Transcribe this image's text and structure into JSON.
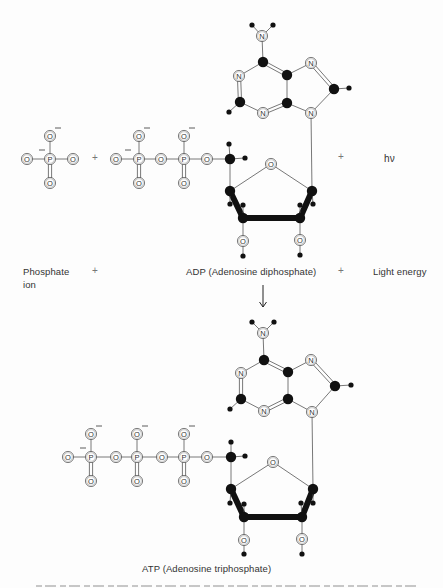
{
  "figure": {
    "background": "#fdfdfd",
    "ink": "#111111",
    "line_color": "#555555"
  },
  "labels": {
    "phosphate_line1": "Phosphate",
    "phosphate_line2": "ion",
    "plus_1": "+",
    "adp": "ADP (Adenosine diphosphate)",
    "plus_2": "+",
    "light_energy": "Light energy",
    "plus_top_1": "+",
    "plus_top_2": "+",
    "h_nu": "hν",
    "atp": "ATP (Adenosine triphosphate)"
  },
  "reaction_arrow": {
    "x": 263,
    "y1": 285,
    "y2": 307
  },
  "molecules": [
    {
      "name": "phosphate-ion",
      "atoms": [
        {
          "el": "O",
          "x": 27,
          "y": 159
        },
        {
          "el": "P",
          "x": 50,
          "y": 159
        },
        {
          "el": "O",
          "x": 73,
          "y": 159
        },
        {
          "el": "O",
          "x": 50,
          "y": 136
        },
        {
          "el": "O",
          "x": 50,
          "y": 183
        }
      ],
      "bonds": [
        [
          0,
          1,
          1
        ],
        [
          1,
          2,
          1
        ],
        [
          1,
          3,
          1
        ],
        [
          1,
          4,
          2
        ]
      ],
      "charges": [
        {
          "x": 39,
          "y": 150
        },
        {
          "x": 55,
          "y": 128
        }
      ]
    },
    {
      "name": "adp",
      "atoms": [
        {
          "el": "O",
          "x": 116,
          "y": 159
        },
        {
          "el": "P",
          "x": 139,
          "y": 159
        },
        {
          "el": "O",
          "x": 139,
          "y": 136
        },
        {
          "el": "O",
          "x": 139,
          "y": 183
        },
        {
          "el": "O",
          "x": 161,
          "y": 159
        },
        {
          "el": "P",
          "x": 184,
          "y": 159
        },
        {
          "el": "O",
          "x": 184,
          "y": 136
        },
        {
          "el": "O",
          "x": 184,
          "y": 183
        },
        {
          "el": "O",
          "x": 207,
          "y": 159
        },
        {
          "el": "C",
          "x": 230,
          "y": 159
        },
        {
          "el": "H",
          "x": 229,
          "y": 144
        },
        {
          "el": "H",
          "x": 245,
          "y": 158
        },
        {
          "el": "O",
          "x": 271,
          "y": 164
        },
        {
          "el": "C",
          "x": 230,
          "y": 191
        },
        {
          "el": "C",
          "x": 312,
          "y": 191
        },
        {
          "el": "C",
          "x": 243,
          "y": 218
        },
        {
          "el": "C",
          "x": 300,
          "y": 218
        },
        {
          "el": "H",
          "x": 230,
          "y": 204
        },
        {
          "el": "H",
          "x": 243,
          "y": 205
        },
        {
          "el": "H",
          "x": 300,
          "y": 205
        },
        {
          "el": "H",
          "x": 313,
          "y": 204
        },
        {
          "el": "O",
          "x": 243,
          "y": 241
        },
        {
          "el": "H",
          "x": 243,
          "y": 256
        },
        {
          "el": "O",
          "x": 300,
          "y": 240
        },
        {
          "el": "H",
          "x": 300,
          "y": 255
        },
        {
          "el": "N",
          "x": 262,
          "y": 36
        },
        {
          "el": "H",
          "x": 252,
          "y": 25
        },
        {
          "el": "H",
          "x": 273,
          "y": 25
        },
        {
          "el": "C",
          "x": 263,
          "y": 62
        },
        {
          "el": "N",
          "x": 239,
          "y": 76
        },
        {
          "el": "C",
          "x": 240,
          "y": 102
        },
        {
          "el": "H",
          "x": 229,
          "y": 112
        },
        {
          "el": "N",
          "x": 263,
          "y": 113
        },
        {
          "el": "C",
          "x": 287,
          "y": 103
        },
        {
          "el": "C",
          "x": 287,
          "y": 75
        },
        {
          "el": "N",
          "x": 311,
          "y": 63
        },
        {
          "el": "C",
          "x": 334,
          "y": 89
        },
        {
          "el": "H",
          "x": 349,
          "y": 88
        },
        {
          "el": "N",
          "x": 311,
          "y": 113
        }
      ],
      "bonds": [
        [
          0,
          1,
          1
        ],
        [
          1,
          2,
          1
        ],
        [
          1,
          3,
          2
        ],
        [
          1,
          4,
          1
        ],
        [
          4,
          5,
          1
        ],
        [
          5,
          6,
          1
        ],
        [
          5,
          7,
          2
        ],
        [
          5,
          8,
          1
        ],
        [
          8,
          9,
          1
        ],
        [
          9,
          10,
          1
        ],
        [
          9,
          11,
          1
        ],
        [
          9,
          13,
          1
        ],
        [
          13,
          12,
          1
        ],
        [
          12,
          14,
          1
        ],
        [
          13,
          15,
          3
        ],
        [
          15,
          16,
          3
        ],
        [
          16,
          14,
          3
        ],
        [
          13,
          17,
          1
        ],
        [
          15,
          18,
          1
        ],
        [
          16,
          19,
          1
        ],
        [
          14,
          20,
          1
        ],
        [
          15,
          21,
          1
        ],
        [
          21,
          22,
          1
        ],
        [
          16,
          23,
          1
        ],
        [
          23,
          24,
          1
        ],
        [
          25,
          26,
          1
        ],
        [
          25,
          27,
          1
        ],
        [
          25,
          28,
          1
        ],
        [
          28,
          29,
          1
        ],
        [
          29,
          30,
          2
        ],
        [
          30,
          31,
          1
        ],
        [
          30,
          32,
          1
        ],
        [
          32,
          33,
          2
        ],
        [
          33,
          34,
          1
        ],
        [
          34,
          28,
          2
        ],
        [
          34,
          35,
          1
        ],
        [
          35,
          36,
          2
        ],
        [
          36,
          37,
          1
        ],
        [
          36,
          38,
          1
        ],
        [
          38,
          33,
          1
        ],
        [
          38,
          14,
          1
        ]
      ],
      "charges": [
        {
          "x": 125,
          "y": 150
        },
        {
          "x": 144,
          "y": 128
        },
        {
          "x": 189,
          "y": 128
        }
      ]
    },
    {
      "name": "atp",
      "atoms": [
        {
          "el": "O",
          "x": 68,
          "y": 457
        },
        {
          "el": "P",
          "x": 91,
          "y": 457
        },
        {
          "el": "O",
          "x": 91,
          "y": 434
        },
        {
          "el": "O",
          "x": 91,
          "y": 481
        },
        {
          "el": "O",
          "x": 116,
          "y": 457
        },
        {
          "el": "P",
          "x": 137,
          "y": 457
        },
        {
          "el": "O",
          "x": 137,
          "y": 434
        },
        {
          "el": "O",
          "x": 137,
          "y": 481
        },
        {
          "el": "O",
          "x": 162,
          "y": 457
        },
        {
          "el": "P",
          "x": 184,
          "y": 457
        },
        {
          "el": "O",
          "x": 184,
          "y": 434
        },
        {
          "el": "O",
          "x": 184,
          "y": 481
        },
        {
          "el": "O",
          "x": 207,
          "y": 457
        },
        {
          "el": "C",
          "x": 231,
          "y": 457
        },
        {
          "el": "H",
          "x": 231,
          "y": 442
        },
        {
          "el": "H",
          "x": 245,
          "y": 456
        },
        {
          "el": "O",
          "x": 273,
          "y": 462
        },
        {
          "el": "C",
          "x": 231,
          "y": 489
        },
        {
          "el": "C",
          "x": 313,
          "y": 489
        },
        {
          "el": "C",
          "x": 244,
          "y": 517
        },
        {
          "el": "C",
          "x": 302,
          "y": 517
        },
        {
          "el": "H",
          "x": 230,
          "y": 503
        },
        {
          "el": "H",
          "x": 244,
          "y": 504
        },
        {
          "el": "H",
          "x": 301,
          "y": 503
        },
        {
          "el": "H",
          "x": 313,
          "y": 503
        },
        {
          "el": "O",
          "x": 244,
          "y": 540
        },
        {
          "el": "H",
          "x": 244,
          "y": 554
        },
        {
          "el": "O",
          "x": 302,
          "y": 539
        },
        {
          "el": "H",
          "x": 302,
          "y": 554
        },
        {
          "el": "N",
          "x": 263,
          "y": 333
        },
        {
          "el": "H",
          "x": 252,
          "y": 322
        },
        {
          "el": "H",
          "x": 274,
          "y": 322
        },
        {
          "el": "C",
          "x": 264,
          "y": 360
        },
        {
          "el": "N",
          "x": 241,
          "y": 373
        },
        {
          "el": "C",
          "x": 241,
          "y": 399
        },
        {
          "el": "H",
          "x": 230,
          "y": 409
        },
        {
          "el": "N",
          "x": 264,
          "y": 411
        },
        {
          "el": "C",
          "x": 288,
          "y": 399
        },
        {
          "el": "C",
          "x": 288,
          "y": 372
        },
        {
          "el": "N",
          "x": 311,
          "y": 360
        },
        {
          "el": "C",
          "x": 335,
          "y": 386
        },
        {
          "el": "H",
          "x": 351,
          "y": 385
        },
        {
          "el": "N",
          "x": 312,
          "y": 412
        }
      ],
      "bonds": [
        [
          0,
          1,
          1
        ],
        [
          1,
          2,
          1
        ],
        [
          1,
          3,
          2
        ],
        [
          1,
          4,
          1
        ],
        [
          4,
          5,
          1
        ],
        [
          5,
          6,
          1
        ],
        [
          5,
          7,
          2
        ],
        [
          5,
          8,
          1
        ],
        [
          8,
          9,
          1
        ],
        [
          9,
          10,
          1
        ],
        [
          9,
          11,
          2
        ],
        [
          9,
          12,
          1
        ],
        [
          12,
          13,
          1
        ],
        [
          13,
          14,
          1
        ],
        [
          13,
          15,
          1
        ],
        [
          13,
          17,
          1
        ],
        [
          17,
          16,
          1
        ],
        [
          16,
          18,
          1
        ],
        [
          17,
          19,
          3
        ],
        [
          19,
          20,
          3
        ],
        [
          20,
          18,
          3
        ],
        [
          17,
          21,
          1
        ],
        [
          19,
          22,
          1
        ],
        [
          20,
          23,
          1
        ],
        [
          18,
          24,
          1
        ],
        [
          19,
          25,
          1
        ],
        [
          25,
          26,
          1
        ],
        [
          20,
          27,
          1
        ],
        [
          27,
          28,
          1
        ],
        [
          29,
          30,
          1
        ],
        [
          29,
          31,
          1
        ],
        [
          29,
          32,
          1
        ],
        [
          32,
          33,
          1
        ],
        [
          33,
          34,
          2
        ],
        [
          34,
          35,
          1
        ],
        [
          34,
          36,
          1
        ],
        [
          36,
          37,
          2
        ],
        [
          37,
          38,
          1
        ],
        [
          38,
          32,
          2
        ],
        [
          38,
          39,
          1
        ],
        [
          39,
          40,
          2
        ],
        [
          40,
          41,
          1
        ],
        [
          40,
          42,
          1
        ],
        [
          42,
          37,
          1
        ],
        [
          42,
          18,
          1
        ]
      ],
      "charges": [
        {
          "x": 80,
          "y": 448
        },
        {
          "x": 96,
          "y": 426
        },
        {
          "x": 142,
          "y": 426
        },
        {
          "x": 189,
          "y": 426
        }
      ]
    }
  ]
}
